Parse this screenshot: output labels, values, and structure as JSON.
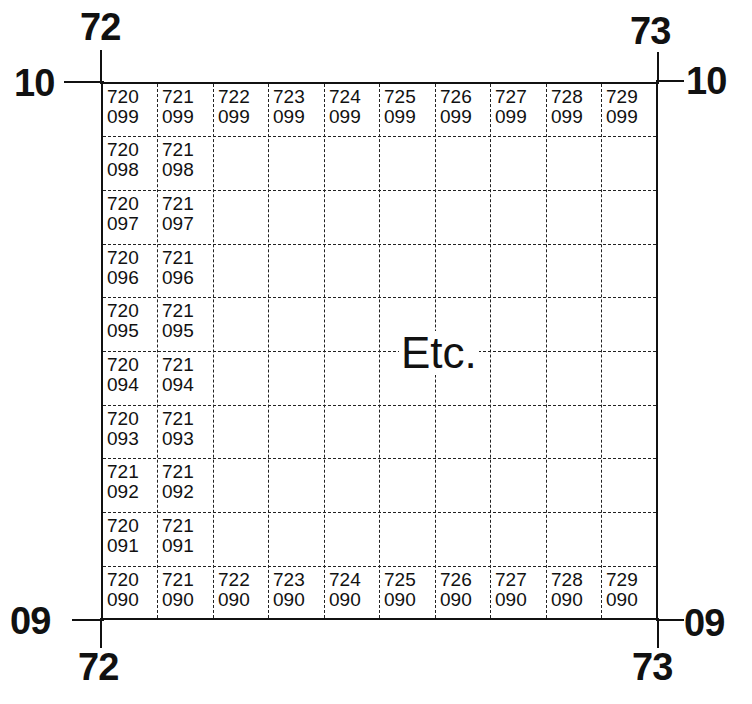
{
  "figure": {
    "corner_labels": {
      "top_left_easting": "72",
      "top_right_easting": "73",
      "bottom_left_easting": "72",
      "bottom_right_easting": "73",
      "top_left_northing": "10",
      "top_right_northing": "10",
      "bottom_left_northing": "09",
      "bottom_right_northing": "09"
    },
    "grid": {
      "columns": 10,
      "rows": 10,
      "top_row": [
        [
          "720",
          "099"
        ],
        [
          "721",
          "099"
        ],
        [
          "722",
          "099"
        ],
        [
          "723",
          "099"
        ],
        [
          "724",
          "099"
        ],
        [
          "725",
          "099"
        ],
        [
          "726",
          "099"
        ],
        [
          "727",
          "099"
        ],
        [
          "728",
          "099"
        ],
        [
          "729",
          "099"
        ]
      ],
      "bottom_row": [
        [
          "720",
          "090"
        ],
        [
          "721",
          "090"
        ],
        [
          "722",
          "090"
        ],
        [
          "723",
          "090"
        ],
        [
          "724",
          "090"
        ],
        [
          "725",
          "090"
        ],
        [
          "726",
          "090"
        ],
        [
          "727",
          "090"
        ],
        [
          "728",
          "090"
        ],
        [
          "729",
          "090"
        ]
      ],
      "left_columns": [
        {
          "row": 1,
          "col1": [
            "720",
            "098"
          ],
          "col2": [
            "721",
            "098"
          ]
        },
        {
          "row": 2,
          "col1": [
            "720",
            "097"
          ],
          "col2": [
            "721",
            "097"
          ]
        },
        {
          "row": 3,
          "col1": [
            "720",
            "096"
          ],
          "col2": [
            "721",
            "096"
          ]
        },
        {
          "row": 4,
          "col1": [
            "720",
            "095"
          ],
          "col2": [
            "721",
            "095"
          ]
        },
        {
          "row": 5,
          "col1": [
            "720",
            "094"
          ],
          "col2": [
            "721",
            "094"
          ]
        },
        {
          "row": 6,
          "col1": [
            "720",
            "093"
          ],
          "col2": [
            "721",
            "093"
          ]
        },
        {
          "row": 7,
          "col1": [
            "721",
            "092"
          ],
          "col2": [
            "721",
            "092"
          ]
        },
        {
          "row": 8,
          "col1": [
            "720",
            "091"
          ],
          "col2": [
            "721",
            "091"
          ]
        }
      ],
      "center_text": "Etc."
    }
  }
}
